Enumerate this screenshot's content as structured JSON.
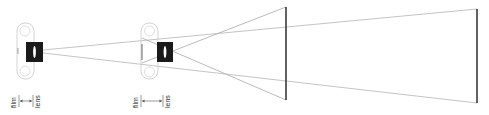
{
  "diagram": {
    "title": "",
    "colors": {
      "ray": "#b5b5b5",
      "screen": "#3a3a3a",
      "lens_block": "#1a1a1a",
      "body_outline": "#c8c8c8",
      "label": "#333333"
    },
    "projectors": [
      {
        "id": "projector-near",
        "labels": {
          "film": "film",
          "lens": "lens"
        },
        "arrow": "double-headed"
      },
      {
        "id": "projector-far",
        "labels": {
          "film": "film",
          "lens": "lens"
        },
        "arrow": "double-headed"
      }
    ],
    "screens": [
      {
        "id": "screen-near"
      },
      {
        "id": "screen-far"
      }
    ]
  }
}
